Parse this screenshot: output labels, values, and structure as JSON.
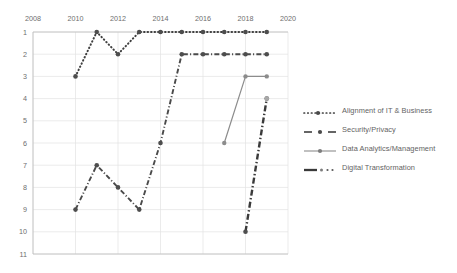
{
  "chart_data": {
    "type": "line",
    "title": "",
    "xlabel": "",
    "ylabel": "",
    "xlim": [
      2008,
      2020
    ],
    "ylim": [
      1,
      11
    ],
    "y_inverted": true,
    "grid": true,
    "legend_position": "right",
    "x_ticks": [
      "2008",
      "2010",
      "2012",
      "2014",
      "2016",
      "2018",
      "2020"
    ],
    "y_ticks": [
      "1",
      "2",
      "3",
      "4",
      "5",
      "6",
      "7",
      "8",
      "9",
      "10",
      "11"
    ],
    "series": [
      {
        "name": "Alignment of IT & Business",
        "style": "dotted",
        "color": "#3f3f3f",
        "x": [
          2010,
          2011,
          2012,
          2013,
          2014,
          2015,
          2016,
          2017,
          2018,
          2019
        ],
        "values": [
          3,
          1,
          2,
          1,
          1,
          1,
          1,
          1,
          1,
          1
        ]
      },
      {
        "name": "Security/Privacy",
        "style": "dash-dot",
        "color": "#4a4a4a",
        "x": [
          2010,
          2011,
          2012,
          2013,
          2014,
          2015,
          2016,
          2017,
          2018,
          2019
        ],
        "values": [
          9,
          7,
          8,
          9,
          6,
          2,
          2,
          2,
          2,
          2
        ]
      },
      {
        "name": "Data Analytics/Management",
        "style": "solid",
        "color": "#8c8c8c",
        "x": [
          2017,
          2018,
          2019
        ],
        "values": [
          6,
          3,
          3
        ]
      },
      {
        "name": "Digital Transformation",
        "style": "dash-dot-heavy",
        "color": "#3a3a3a",
        "x": [
          2018,
          2019
        ],
        "values": [
          10,
          4
        ]
      }
    ]
  },
  "legend": {
    "items": [
      {
        "label": "Alignment of IT & Business",
        "swatch": "dotted-marker-line"
      },
      {
        "label": "Security/Privacy",
        "swatch": "dashdot-marker-line"
      },
      {
        "label": "Data Analytics/Management",
        "swatch": "solid-marker-line"
      },
      {
        "label": "Digital Transformation",
        "swatch": "heavy-dashdot-line"
      }
    ]
  }
}
